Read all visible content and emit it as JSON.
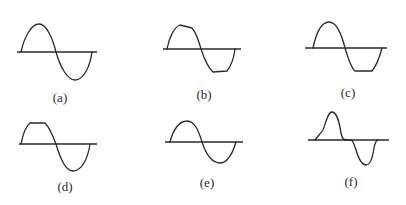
{
  "figure": {
    "panels": [
      {
        "id": "a",
        "label": "(a)",
        "description": "pure sine wave"
      },
      {
        "id": "b",
        "label": "(b)",
        "description": "sine wave with sloped flattened peaks"
      },
      {
        "id": "c",
        "label": "(c)",
        "description": "sine wave with clipped negative half"
      },
      {
        "id": "d",
        "label": "(d)",
        "description": "sine wave with clipped positive half"
      },
      {
        "id": "e",
        "label": "(e)",
        "description": "sine wave (positive lobe smaller than negative)"
      },
      {
        "id": "f",
        "label": "(f)",
        "description": "crossover-distorted sine wave"
      }
    ],
    "colors": {
      "stroke": "#2a2a2a",
      "background": "#ffffff"
    }
  }
}
